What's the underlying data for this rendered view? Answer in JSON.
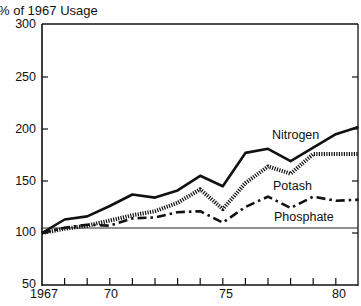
{
  "chart_data": {
    "type": "line",
    "title": "",
    "ylabel": "% of 1967 Usage",
    "xlabel": "",
    "ylim": [
      50,
      300
    ],
    "yticks": [
      50,
      100,
      150,
      200,
      250,
      300
    ],
    "xticks_labels": [
      "1967",
      "70",
      "75",
      "80"
    ],
    "grid": false,
    "reference_line": 100,
    "x": [
      1967,
      1968,
      1969,
      1970,
      1971,
      1972,
      1973,
      1974,
      1975,
      1976,
      1977,
      1978,
      1979,
      1980,
      1981
    ],
    "series": [
      {
        "name": "Nitrogen",
        "style": "solid",
        "values": [
          100,
          113,
          116,
          126,
          137,
          134,
          141,
          155,
          145,
          177,
          181,
          169,
          182,
          195,
          202
        ]
      },
      {
        "name": "Potash",
        "style": "dotted",
        "values": [
          100,
          104,
          107,
          112,
          117,
          121,
          129,
          142,
          123,
          148,
          164,
          157,
          176,
          176,
          176
        ]
      },
      {
        "name": "Phosphate",
        "style": "dash-dot",
        "values": [
          100,
          105,
          108,
          107,
          114,
          115,
          120,
          121,
          110,
          125,
          135,
          124,
          135,
          131,
          132
        ]
      }
    ],
    "legend_position": "inline labels near line ends"
  },
  "labels": {
    "y_title": "% of 1967 Usage",
    "y_ticks": [
      "300",
      "250",
      "200",
      "150",
      "100",
      "50"
    ],
    "x_ticks": [
      "1967",
      "70",
      "75",
      "80"
    ],
    "nitrogen": "Nitrogen",
    "potash": "Potash",
    "phosphate": "Phosphate"
  },
  "colors": {
    "ink": "#111111",
    "background": "#ffffff"
  }
}
